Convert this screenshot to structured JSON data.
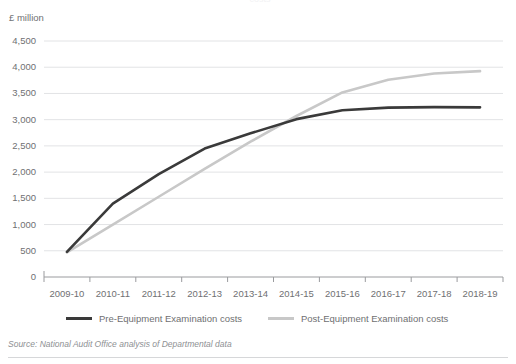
{
  "clipped_title": "costs",
  "y_axis_title": "£ million",
  "source_note": "Source: National Audit Office analysis of Departmental data",
  "legend": {
    "items": [
      {
        "label": "Pre-Equipment Examination costs",
        "color": "#3a3a3a",
        "swatch_name": "legend-swatch-pre"
      },
      {
        "label": "Post-Equipment Examination costs",
        "color": "#c8c8c8",
        "swatch_name": "legend-swatch-post"
      }
    ]
  },
  "colors": {
    "pre_line": "#3a3a3a",
    "post_line": "#c8c8c8",
    "gridline": "#e2e3e5",
    "axis": "#9a9b9e",
    "text": "#6f7072",
    "source_text": "#8e9093"
  },
  "chart_data": {
    "type": "line",
    "title": "",
    "subtitle": "",
    "xlabel": "",
    "ylabel": "£ million",
    "ylim": [
      0,
      4500
    ],
    "ytick_step": 500,
    "yticks": [
      0,
      500,
      1000,
      1500,
      2000,
      2500,
      3000,
      3500,
      4000,
      4500
    ],
    "ytick_labels": [
      "0",
      "500",
      "1,000",
      "1,500",
      "2,000",
      "2,500",
      "3,000",
      "3,500",
      "4,000",
      "4,500"
    ],
    "categories": [
      "2009-10",
      "2010-11",
      "2011-12",
      "2012-13",
      "2013-14",
      "2014-15",
      "2015-16",
      "2016-17",
      "2017-18",
      "2018-19"
    ],
    "grid": "horizontal",
    "legend_position": "bottom",
    "series": [
      {
        "name": "Pre-Equipment Examination costs",
        "color": "#3a3a3a",
        "values": [
          480,
          1400,
          1960,
          2450,
          2740,
          3010,
          3180,
          3230,
          3240,
          3235
        ]
      },
      {
        "name": "Post-Equipment Examination costs",
        "color": "#c8c8c8",
        "values": [
          470,
          1000,
          1530,
          2060,
          2580,
          3070,
          3520,
          3760,
          3880,
          3925
        ]
      }
    ]
  }
}
